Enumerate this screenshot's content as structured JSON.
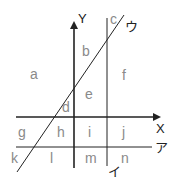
{
  "diagram": {
    "axes": {
      "x_label": "X",
      "y_label": "Y"
    },
    "lines": {
      "horizontal_line_label": "ア",
      "vertical_line_label": "イ",
      "diagonal_line_label": "ウ"
    },
    "regions": {
      "a": "a",
      "b": "b",
      "c": "c",
      "d": "d",
      "e": "e",
      "f": "f",
      "g": "g",
      "h": "h",
      "i": "i",
      "j": "j",
      "k": "k",
      "l": "l",
      "m": "m",
      "n": "n"
    },
    "colors": {
      "lines": "#222222",
      "region_labels": "#8a8a8a"
    }
  }
}
